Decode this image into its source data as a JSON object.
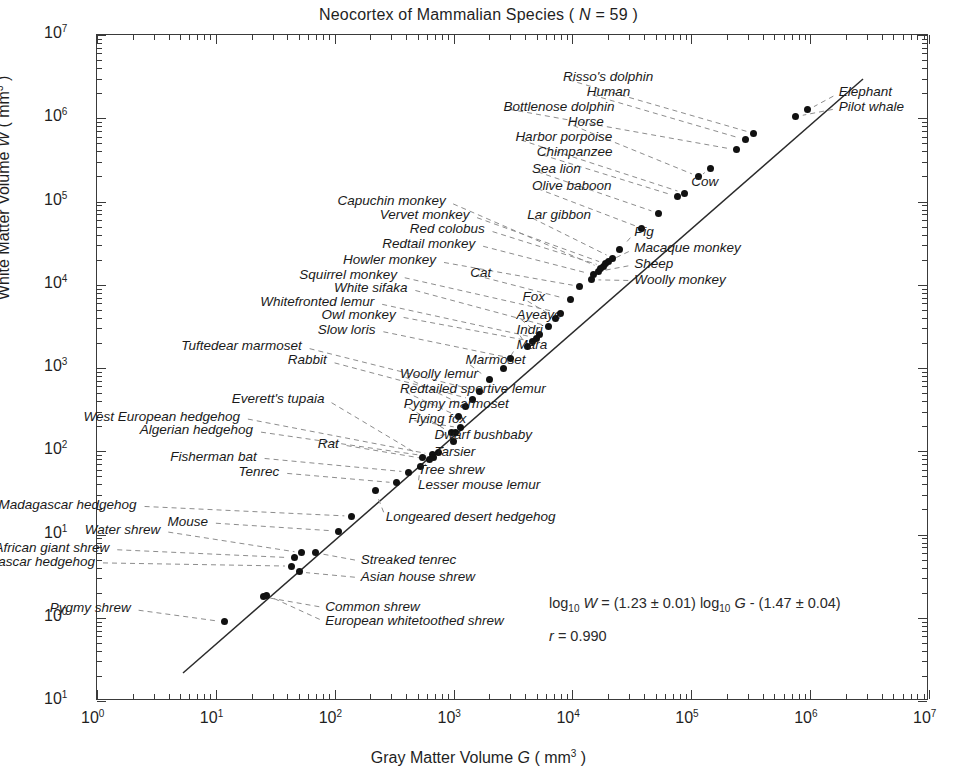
{
  "chart_data": {
    "type": "scatter",
    "title": "Neocortex of Mammalian Species ( N = 59 )",
    "title_parts": {
      "pre": "Neocortex of Mammalian Species ( ",
      "symbol": "N",
      "post": " = 59 )"
    },
    "xlabel": "Gray Matter Volume G ( mm3 )",
    "xlabel_parts": {
      "pre": "Gray Matter Volume ",
      "symbol": "G",
      "post": " ( mm",
      "exp": "3",
      "tail": " )"
    },
    "ylabel": "White Matter Volume W ( mm3 )",
    "ylabel_parts": {
      "pre": "White Matter Volume ",
      "symbol": "W",
      "post": " ( mm",
      "exp": "3",
      "tail": " )"
    },
    "xscale": "log10",
    "yscale": "log10",
    "xlim": [
      0,
      7
    ],
    "ylim": [
      -1,
      7
    ],
    "xticks": [
      "10^0",
      "10^1",
      "10^2",
      "10^3",
      "10^4",
      "10^5",
      "10^6",
      "10^7"
    ],
    "yticks": [
      "10^7",
      "10^6",
      "10^5",
      "10^4",
      "10^3",
      "10^2",
      "10^1",
      "10^0",
      "10^1"
    ],
    "grid": false,
    "legend": "none",
    "n_points": 59,
    "fit": {
      "equation": "log10 W = (1.23 ± 0.01) log10 G - (1.47 ± 0.04)",
      "slope": 1.23,
      "slope_err": 0.01,
      "intercept": -1.47,
      "intercept_err": 0.04,
      "r": 0.99,
      "r_text": "r = 0.990",
      "eq_tokens": {
        "log1": "log",
        "sub1": "10",
        "W": "W",
        "eq": "= (1.23 ± 0.01) ",
        "log2": "log",
        "sub2": "10",
        "G": "G",
        "tail": "- (1.47 ± 0.04)"
      }
    },
    "points": [
      {
        "label": "Pygmy shrew",
        "logG": 1.07,
        "logW": -0.05
      },
      {
        "label": "Common shrew",
        "logG": 1.4,
        "logW": 0.25
      },
      {
        "label": "European whitetoothed shrew",
        "logG": 1.43,
        "logW": 0.27
      },
      {
        "label": "Small Madagascar hedgehog",
        "logG": 1.64,
        "logW": 0.62
      },
      {
        "label": "South African giant shrew",
        "logG": 1.66,
        "logW": 0.72
      },
      {
        "label": "Water shrew",
        "logG": 1.72,
        "logW": 0.78
      },
      {
        "label": "Asian house shrew",
        "logG": 1.7,
        "logW": 0.55
      },
      {
        "label": "Streaked tenrec",
        "logG": 1.84,
        "logW": 0.78
      },
      {
        "label": "Mouse",
        "logG": 2.03,
        "logW": 1.04
      },
      {
        "label": "Large Madagascar hedgehog",
        "logG": 2.14,
        "logW": 1.22
      },
      {
        "label": "Longeared desert hedgehog",
        "logG": 2.34,
        "logW": 1.53
      },
      {
        "label": "Tenrec",
        "logG": 2.52,
        "logW": 1.62
      },
      {
        "label": "Fisherman bat",
        "logG": 2.62,
        "logW": 1.75
      },
      {
        "label": "Lesser mouse lemur",
        "logG": 2.72,
        "logW": 1.82
      },
      {
        "label": "Tree shrew",
        "logG": 2.87,
        "logW": 1.98
      },
      {
        "label": "Rat",
        "logG": 2.8,
        "logW": 1.9
      },
      {
        "label": "West European hedgehog",
        "logG": 2.82,
        "logW": 1.96
      },
      {
        "label": "Algerian hedgehog",
        "logG": 2.83,
        "logW": 1.93
      },
      {
        "label": "Tarsier",
        "logG": 3.0,
        "logW": 2.12
      },
      {
        "label": "Dwarf bushbaby",
        "logG": 3.02,
        "logW": 2.22
      },
      {
        "label": "Flying fox",
        "logG": 3.06,
        "logW": 2.28
      },
      {
        "label": "Pygmy marmoset",
        "logG": 2.98,
        "logW": 2.22
      },
      {
        "label": "Everett's tupaia",
        "logG": 2.74,
        "logW": 1.93
      },
      {
        "label": "Redtailed sportive lemur",
        "logG": 3.04,
        "logW": 2.42
      },
      {
        "label": "Woolly lemur",
        "logG": 3.1,
        "logW": 2.54
      },
      {
        "label": "Rabbit",
        "logG": 3.16,
        "logW": 2.62
      },
      {
        "label": "Tuftedear marmoset",
        "logG": 3.22,
        "logW": 2.72
      },
      {
        "label": "Marmoset",
        "logG": 3.3,
        "logW": 2.86
      },
      {
        "label": "Mara",
        "logG": 3.42,
        "logW": 3.0
      },
      {
        "label": "Slow loris",
        "logG": 3.48,
        "logW": 3.12
      },
      {
        "label": "Indri",
        "logG": 3.62,
        "logW": 3.26
      },
      {
        "label": "Owl monkey",
        "logG": 3.66,
        "logW": 3.32
      },
      {
        "label": "Ayeaye",
        "logG": 3.72,
        "logW": 3.4
      },
      {
        "label": "Whitefronted lemur",
        "logG": 3.7,
        "logW": 3.36
      },
      {
        "label": "White sifaka",
        "logG": 3.8,
        "logW": 3.5
      },
      {
        "label": "Fox",
        "logG": 3.86,
        "logW": 3.6
      },
      {
        "label": "Squirrel monkey",
        "logG": 3.9,
        "logW": 3.66
      },
      {
        "label": "Cat",
        "logG": 3.98,
        "logW": 3.82
      },
      {
        "label": "Howler monkey",
        "logG": 4.06,
        "logW": 3.98
      },
      {
        "label": "Woolly monkey",
        "logG": 4.16,
        "logW": 4.06
      },
      {
        "label": "Redtail monkey",
        "logG": 4.18,
        "logW": 4.12
      },
      {
        "label": "Sheep",
        "logG": 4.22,
        "logW": 4.16
      },
      {
        "label": "Red colobus",
        "logG": 4.26,
        "logW": 4.22
      },
      {
        "label": "Macaque monkey",
        "logG": 4.3,
        "logW": 4.28
      },
      {
        "label": "Vervet monkey",
        "logG": 4.28,
        "logW": 4.25
      },
      {
        "label": "Capuchin monkey",
        "logG": 4.24,
        "logW": 4.2
      },
      {
        "label": "Lar gibbon",
        "logG": 4.34,
        "logW": 4.32
      },
      {
        "label": "Pig",
        "logG": 4.4,
        "logW": 4.42
      },
      {
        "label": "Olive baboon",
        "logG": 4.58,
        "logW": 4.68
      },
      {
        "label": "Sea lion",
        "logG": 4.72,
        "logW": 4.86
      },
      {
        "label": "Chimpanzee",
        "logG": 4.88,
        "logW": 5.06
      },
      {
        "label": "Harbor porpoise",
        "logG": 4.94,
        "logW": 5.1
      },
      {
        "label": "Horse",
        "logG": 5.06,
        "logW": 5.3
      },
      {
        "label": "Cow",
        "logG": 5.16,
        "logW": 5.4
      },
      {
        "label": "Bottlenose dolphin",
        "logG": 5.38,
        "logW": 5.62
      },
      {
        "label": "Human",
        "logG": 5.46,
        "logW": 5.74
      },
      {
        "label": "Risso's dolphin",
        "logG": 5.52,
        "logW": 5.82
      },
      {
        "label": "Pilot whale",
        "logG": 5.88,
        "logW": 6.02
      },
      {
        "label": "Elephant",
        "logG": 5.98,
        "logW": 6.1
      }
    ],
    "annotations": {
      "upper_right": [
        "Elephant",
        "Pilot whale"
      ],
      "bottom_right_text": [
        "log10 W = (1.23 ± 0.01) log10 G - (1.47 ± 0.04)",
        "r = 0.990"
      ]
    }
  }
}
